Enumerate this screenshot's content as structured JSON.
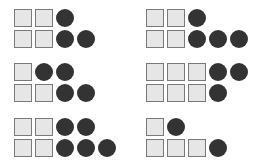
{
  "colors": {
    "square_fill": "#e6e6e6",
    "square_border": "#7a7a7a",
    "circle_fill": "#333333",
    "background": "#ffffff"
  },
  "groups": [
    {
      "id": "top-left",
      "rows": [
        [
          "square",
          "square",
          "circle"
        ],
        [
          "square",
          "square",
          "circle",
          "circle"
        ]
      ]
    },
    {
      "id": "top-right",
      "rows": [
        [
          "square",
          "square",
          "circle"
        ],
        [
          "square",
          "square",
          "circle",
          "circle",
          "circle"
        ]
      ]
    },
    {
      "id": "middle-left",
      "rows": [
        [
          "square",
          "circle",
          "circle"
        ],
        [
          "square",
          "square",
          "circle",
          "circle"
        ]
      ]
    },
    {
      "id": "middle-right",
      "rows": [
        [
          "square",
          "square",
          "square",
          "circle",
          "circle"
        ],
        [
          "square",
          "square",
          "square",
          "circle"
        ]
      ]
    },
    {
      "id": "bottom-left",
      "rows": [
        [
          "square",
          "square",
          "circle",
          "circle"
        ],
        [
          "square",
          "square",
          "circle",
          "circle",
          "circle"
        ]
      ]
    },
    {
      "id": "bottom-right",
      "rows": [
        [
          "square",
          "circle"
        ],
        [
          "square",
          "square",
          "square",
          "circle"
        ]
      ]
    }
  ]
}
